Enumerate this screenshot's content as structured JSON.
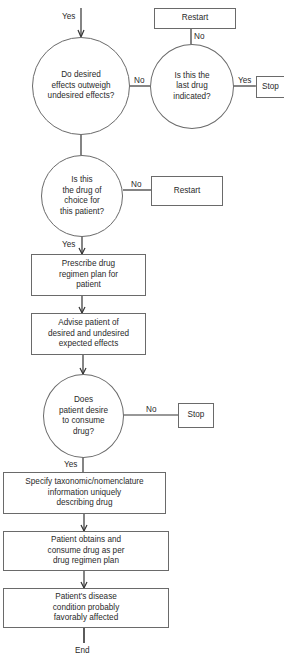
{
  "diagram": {
    "type": "flowchart",
    "nodes": {
      "q_outweigh": {
        "shape": "circle",
        "text": "Do desired\neffects outweigh\nundesired effects?"
      },
      "q_last_drug": {
        "shape": "circle",
        "text": "Is this the\nlast drug\nindicated?"
      },
      "restart_1": {
        "shape": "box",
        "text": "Restart"
      },
      "stop_1": {
        "shape": "box",
        "text": "Stop"
      },
      "q_drug_of_choice": {
        "shape": "circle",
        "text": "Is this\nthe drug of\nchoice for\nthis patient?"
      },
      "restart_2": {
        "shape": "box",
        "text": "Restart"
      },
      "prescribe": {
        "shape": "box",
        "text": "Prescribe drug\nregimen plan for\npatient"
      },
      "advise": {
        "shape": "box",
        "text": "Advise patient of\ndesired and undesired\nexpected effects"
      },
      "q_consume": {
        "shape": "circle",
        "text": "Does\npatient desire\nto consume\ndrug?"
      },
      "stop_2": {
        "shape": "box",
        "text": "Stop"
      },
      "specify": {
        "shape": "box",
        "text": "Specify taxonomic/nomenclature\ninformation uniquely\ndescribing drug"
      },
      "obtain": {
        "shape": "box",
        "text": "Patient obtains and\nconsume drug as per\ndrug regimen plan"
      },
      "outcome": {
        "shape": "box",
        "text": "Patient's disease\ncondition probably\nfavorably affected"
      }
    },
    "edge_labels": {
      "entry_yes": "Yes",
      "outweigh_no": "No",
      "last_drug_no": "No",
      "last_drug_yes": "Yes",
      "choice_no": "No",
      "choice_yes": "Yes",
      "consume_no": "No",
      "consume_yes": "Yes",
      "end": "End"
    },
    "edges": [
      {
        "from": "entry",
        "to": "q_outweigh",
        "label": "Yes"
      },
      {
        "from": "q_outweigh",
        "to": "q_last_drug",
        "label": "No"
      },
      {
        "from": "q_last_drug",
        "to": "restart_1",
        "label": "No"
      },
      {
        "from": "q_last_drug",
        "to": "stop_1",
        "label": "Yes"
      },
      {
        "from": "q_outweigh",
        "to": "q_drug_of_choice",
        "label": ""
      },
      {
        "from": "q_drug_of_choice",
        "to": "restart_2",
        "label": "No"
      },
      {
        "from": "q_drug_of_choice",
        "to": "prescribe",
        "label": "Yes"
      },
      {
        "from": "prescribe",
        "to": "advise",
        "label": ""
      },
      {
        "from": "advise",
        "to": "q_consume",
        "label": ""
      },
      {
        "from": "q_consume",
        "to": "stop_2",
        "label": "No"
      },
      {
        "from": "q_consume",
        "to": "specify",
        "label": "Yes"
      },
      {
        "from": "specify",
        "to": "obtain",
        "label": ""
      },
      {
        "from": "obtain",
        "to": "outcome",
        "label": ""
      },
      {
        "from": "outcome",
        "to": "end",
        "label": "End"
      }
    ],
    "colors": {
      "stroke": "#6a6a6a",
      "line": "#333333",
      "text": "#2a2a2a",
      "background": "#ffffff"
    }
  }
}
